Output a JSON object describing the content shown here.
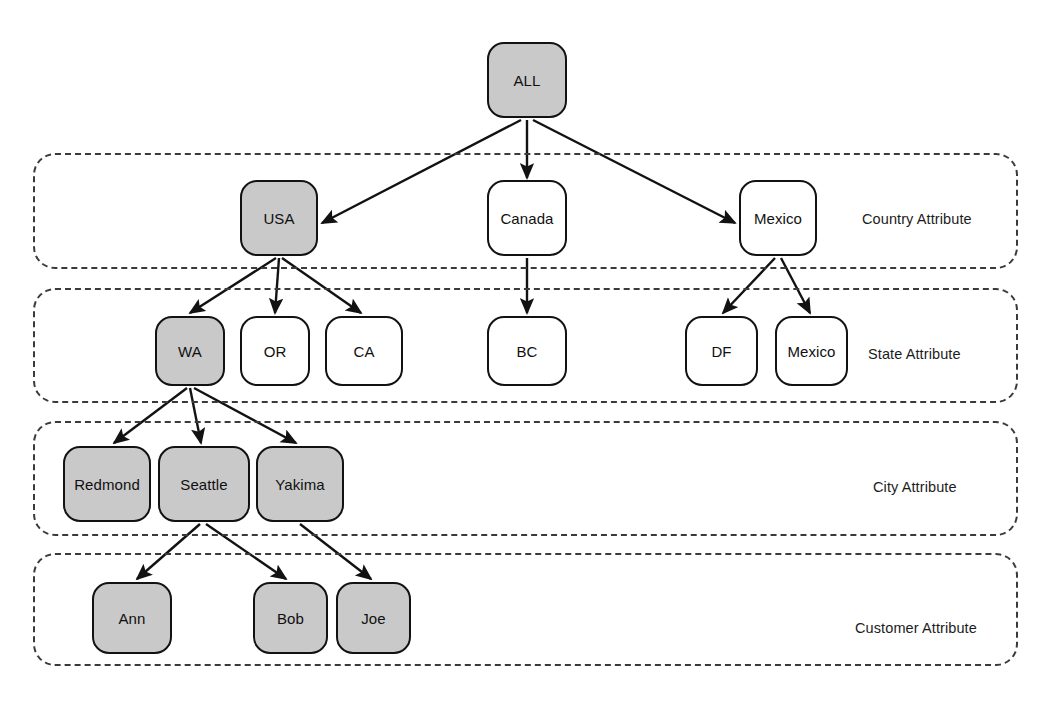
{
  "diagram": {
    "colors": {
      "node_fill_selected": "#c9c9c9",
      "node_fill_default": "#ffffff",
      "node_stroke": "#121212",
      "tier_border": "#3a3a3a",
      "edge": "#121212",
      "background": "#ffffff"
    },
    "tiers": [
      {
        "id": "country",
        "label": "Country Attribute",
        "x": 33,
        "y": 153,
        "w": 985,
        "h": 116,
        "label_x": 862,
        "label_y": 211
      },
      {
        "id": "state",
        "label": "State Attribute",
        "x": 33,
        "y": 288,
        "w": 985,
        "h": 115,
        "label_x": 868,
        "label_y": 346
      },
      {
        "id": "city",
        "label": "City Attribute",
        "x": 33,
        "y": 421,
        "w": 985,
        "h": 115,
        "label_x": 873,
        "label_y": 479
      },
      {
        "id": "customer",
        "label": "Customer Attribute",
        "x": 33,
        "y": 553,
        "w": 985,
        "h": 113,
        "label_x": 855,
        "label_y": 620
      }
    ],
    "nodes": [
      {
        "id": "all",
        "label": "ALL",
        "x": 487,
        "y": 42,
        "w": 80,
        "h": 76,
        "selected": true
      },
      {
        "id": "usa",
        "label": "USA",
        "x": 240,
        "y": 180,
        "w": 78,
        "h": 76,
        "selected": true
      },
      {
        "id": "canada",
        "label": "Canada",
        "x": 487,
        "y": 180,
        "w": 80,
        "h": 76,
        "selected": false
      },
      {
        "id": "mexico",
        "label": "Mexico",
        "x": 739,
        "y": 180,
        "w": 78,
        "h": 76,
        "selected": false
      },
      {
        "id": "wa",
        "label": "WA",
        "x": 155,
        "y": 316,
        "w": 70,
        "h": 70,
        "selected": true
      },
      {
        "id": "or",
        "label": "OR",
        "x": 240,
        "y": 316,
        "w": 70,
        "h": 70,
        "selected": false
      },
      {
        "id": "ca",
        "label": "CA",
        "x": 325,
        "y": 316,
        "w": 78,
        "h": 70,
        "selected": false
      },
      {
        "id": "bc",
        "label": "BC",
        "x": 487,
        "y": 316,
        "w": 80,
        "h": 70,
        "selected": false
      },
      {
        "id": "df",
        "label": "DF",
        "x": 685,
        "y": 316,
        "w": 73,
        "h": 70,
        "selected": false
      },
      {
        "id": "mexico-state",
        "label": "Mexico",
        "x": 775,
        "y": 316,
        "w": 73,
        "h": 70,
        "selected": false
      },
      {
        "id": "redmond",
        "label": "Redmond",
        "x": 63,
        "y": 446,
        "w": 88,
        "h": 76,
        "selected": true
      },
      {
        "id": "seattle",
        "label": "Seattle",
        "x": 158,
        "y": 446,
        "w": 92,
        "h": 76,
        "selected": true
      },
      {
        "id": "yakima",
        "label": "Yakima",
        "x": 256,
        "y": 446,
        "w": 88,
        "h": 76,
        "selected": true
      },
      {
        "id": "ann",
        "label": "Ann",
        "x": 92,
        "y": 582,
        "w": 80,
        "h": 72,
        "selected": true
      },
      {
        "id": "bob",
        "label": "Bob",
        "x": 253,
        "y": 582,
        "w": 75,
        "h": 72,
        "selected": true
      },
      {
        "id": "joe",
        "label": "Joe",
        "x": 336,
        "y": 582,
        "w": 75,
        "h": 72,
        "selected": true
      }
    ],
    "edges": [
      {
        "id": "all-usa",
        "from": "all",
        "to": "usa",
        "x1": 521,
        "y1": 120,
        "x2": 322,
        "y2": 223
      },
      {
        "id": "all-canada",
        "from": "all",
        "to": "canada",
        "x1": 527,
        "y1": 120,
        "x2": 527,
        "y2": 178
      },
      {
        "id": "all-mexico",
        "from": "all",
        "to": "mexico",
        "x1": 533,
        "y1": 120,
        "x2": 735,
        "y2": 223
      },
      {
        "id": "usa-wa",
        "from": "usa",
        "to": "wa",
        "x1": 276,
        "y1": 258,
        "x2": 190,
        "y2": 313
      },
      {
        "id": "usa-or",
        "from": "usa",
        "to": "or",
        "x1": 279,
        "y1": 258,
        "x2": 275,
        "y2": 313
      },
      {
        "id": "usa-ca",
        "from": "usa",
        "to": "ca",
        "x1": 282,
        "y1": 258,
        "x2": 361,
        "y2": 313
      },
      {
        "id": "canada-bc",
        "from": "canada",
        "to": "bc",
        "x1": 527,
        "y1": 258,
        "x2": 527,
        "y2": 313
      },
      {
        "id": "mexico-df",
        "from": "mexico",
        "to": "df",
        "x1": 775,
        "y1": 258,
        "x2": 723,
        "y2": 313
      },
      {
        "id": "mexico-mexico",
        "from": "mexico",
        "to": "mexico-state",
        "x1": 781,
        "y1": 258,
        "x2": 810,
        "y2": 313
      },
      {
        "id": "wa-redmond",
        "from": "wa",
        "to": "redmond",
        "x1": 187,
        "y1": 388,
        "x2": 114,
        "y2": 443
      },
      {
        "id": "wa-seattle",
        "from": "wa",
        "to": "seattle",
        "x1": 190,
        "y1": 388,
        "x2": 201,
        "y2": 443
      },
      {
        "id": "wa-yakima",
        "from": "wa",
        "to": "yakima",
        "x1": 194,
        "y1": 388,
        "x2": 296,
        "y2": 443
      },
      {
        "id": "seattle-ann",
        "from": "seattle",
        "to": "ann",
        "x1": 200,
        "y1": 524,
        "x2": 137,
        "y2": 579
      },
      {
        "id": "seattle-bob",
        "from": "seattle",
        "to": "bob",
        "x1": 206,
        "y1": 524,
        "x2": 286,
        "y2": 579
      },
      {
        "id": "yakima-joe",
        "from": "yakima",
        "to": "joe",
        "x1": 300,
        "y1": 524,
        "x2": 371,
        "y2": 579
      }
    ]
  }
}
